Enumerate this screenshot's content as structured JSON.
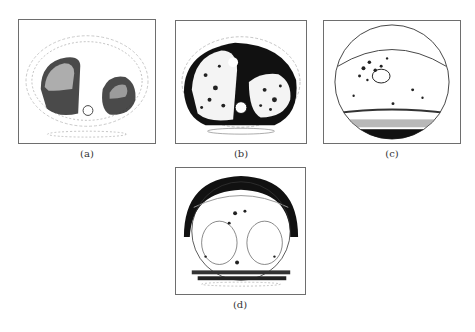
{
  "figure": {
    "subfigures": [
      {
        "id": "a",
        "label": "(a)",
        "content": "axial chest CT slice, thresholded, dense dark speckled lungs"
      },
      {
        "id": "b",
        "label": "(b)",
        "content": "axial chest CT slice, thresholded, dark heart and muscle regions"
      },
      {
        "id": "c",
        "label": "(c)",
        "content": "axial chest CT slice, thresholded, circular field of view with sparse speckle"
      },
      {
        "id": "d",
        "label": "(d)",
        "content": "axial chest CT slice, thresholded, dark crescent at top of field of view"
      }
    ]
  }
}
